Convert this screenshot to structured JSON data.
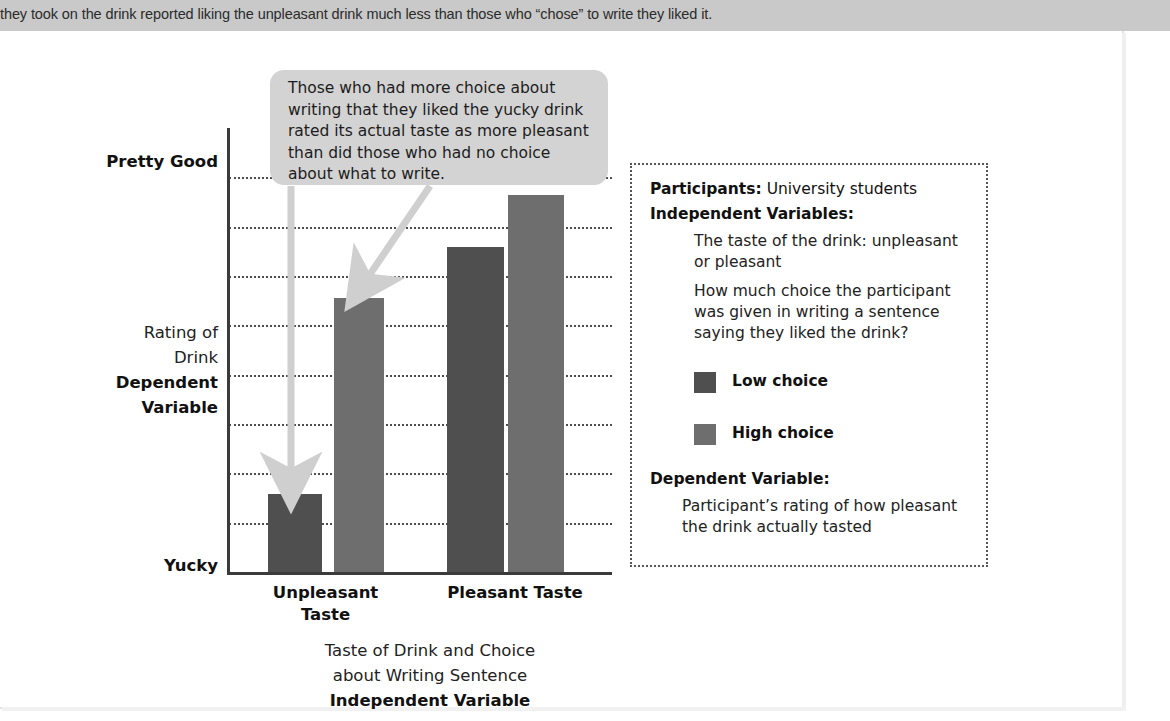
{
  "top_band": {
    "text": "they took on the drink reported liking the unpleasant drink much less than those who “chose” to write they liked it."
  },
  "callout": {
    "text": "Those who had more choice about writing that they liked the yucky drink rated its actual taste as more pleasant than did those who had no choice about what to write."
  },
  "info_box": {
    "participants_label": "Participants:",
    "participants_value": " University students",
    "independent_variables_label": "Independent Variables:",
    "iv_1": "The taste of the drink: unpleasant or pleasant",
    "iv_2": "How much choice the participant was given in writing a sentence saying they liked the drink?",
    "legend": [
      {
        "label": "Low choice",
        "color": "#4f4f4f"
      },
      {
        "label": "High choice",
        "color": "#6e6e6e"
      }
    ],
    "dependent_variable_label": "Dependent Variable:",
    "dependent_variable_body": "Participant’s rating of how pleasant the drink actually tasted"
  },
  "chart_data": {
    "type": "bar",
    "title": "",
    "xlabel_line1": "Taste of Drink and Choice",
    "xlabel_line2": "about Writing Sentence",
    "xlabel_line3": "Independent Variable",
    "ylabel_line1": "Rating of",
    "ylabel_line2": "Drink",
    "ylabel_line3": "Dependent",
    "ylabel_line4": "Variable",
    "y_axis_top_label": "Pretty Good",
    "y_axis_bottom_label": "Yucky",
    "ylim": [
      0,
      9
    ],
    "y_gridline_values": [
      1,
      2,
      3,
      4,
      5,
      6,
      7,
      8
    ],
    "grid": true,
    "legend_position": "right-panel",
    "categories": [
      "Unpleasant Taste",
      "Pleasant Taste"
    ],
    "series": [
      {
        "name": "Low choice",
        "color": "#4f4f4f",
        "values": [
          1.7,
          7.0
        ]
      },
      {
        "name": "High choice",
        "color": "#6e6e6e",
        "values": [
          5.9,
          8.1
        ]
      }
    ],
    "bars": [
      {
        "group": "Unpleasant Taste",
        "series": "Low choice",
        "value": 1.7,
        "color": "#4f4f4f",
        "x": 268,
        "width": 54,
        "top": 494
      },
      {
        "group": "Unpleasant Taste",
        "series": "High choice",
        "value": 5.9,
        "color": "#6e6e6e",
        "x": 334,
        "width": 50,
        "top": 298
      },
      {
        "group": "Pleasant Taste",
        "series": "Low choice",
        "value": 7.0,
        "color": "#4f4f4f",
        "x": 447,
        "width": 57,
        "top": 247
      },
      {
        "group": "Pleasant Taste",
        "series": "High choice",
        "value": 8.1,
        "color": "#6e6e6e",
        "x": 508,
        "width": 56,
        "top": 195
      }
    ],
    "annotations": [
      {
        "name": "callout-to-low-choice-bar",
        "text": "arrow to Unpleasant / Low choice bar"
      },
      {
        "name": "callout-to-high-choice-bar",
        "text": "arrow to Unpleasant / High choice bar"
      }
    ]
  },
  "colors": {
    "top_band": "#c9c9c9",
    "callout_bg": "#d3d3d3",
    "bar_low_choice": "#4f4f4f",
    "bar_high_choice": "#6e6e6e",
    "axis": "#3b3b3b",
    "arrow": "#cfcfcf"
  }
}
